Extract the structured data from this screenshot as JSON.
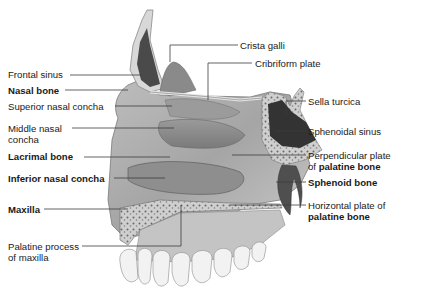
{
  "figure": {
    "colors": {
      "background": "#ffffff",
      "bone_light": "#d9d9d9",
      "bone_mid": "#a8a8a8",
      "bone_dark": "#6e6e6e",
      "sinus_dark": "#3a3a3a",
      "leader_line": "#3c3c3c",
      "text": "#1a1a1a"
    }
  },
  "labels_left": [
    {
      "id": "frontal-sinus",
      "text": "Frontal sinus",
      "bold": false
    },
    {
      "id": "nasal-bone",
      "text": "Nasal bone",
      "bold": true
    },
    {
      "id": "superior-nasal-concha",
      "text": "Superior nasal concha",
      "bold": false
    },
    {
      "id": "middle-nasal-concha",
      "line1": "Middle nasal",
      "line2": "concha",
      "bold": false
    },
    {
      "id": "lacrimal-bone",
      "text": "Lacrimal bone",
      "bold": true
    },
    {
      "id": "inferior-nasal-concha",
      "text": "Inferior nasal concha",
      "bold": true
    },
    {
      "id": "maxilla",
      "text": "Maxilla",
      "bold": true
    },
    {
      "id": "palatine-process",
      "line1": "Palatine process",
      "line2": "of maxilla",
      "bold": false
    }
  ],
  "labels_top": [
    {
      "id": "crista-galli",
      "text": "Crista galli",
      "bold": false
    },
    {
      "id": "cribriform-plate",
      "text": "Cribriform plate",
      "bold": false
    }
  ],
  "labels_right": [
    {
      "id": "sella-turcica",
      "text": "Sella turcica",
      "bold": false
    },
    {
      "id": "sphenoidal-sinus",
      "text": "Sphenoidal sinus",
      "bold": false
    },
    {
      "id": "perpendicular-plate",
      "line1": "Perpendicular plate",
      "line2_prefix": "of ",
      "line2_bold": "palatine bone"
    },
    {
      "id": "sphenoid-bone",
      "text": "Sphenoid bone",
      "bold": true
    },
    {
      "id": "horizontal-plate",
      "line1": "Horizontal plate of",
      "line2_bold": "palatine bone"
    }
  ]
}
